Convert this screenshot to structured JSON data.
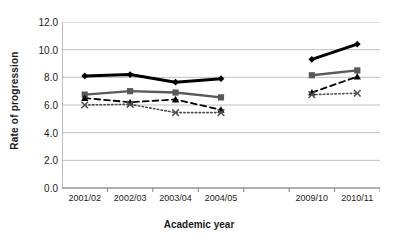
{
  "chart_data": {
    "type": "line",
    "title": "",
    "xlabel": "Academic year",
    "ylabel": "Rate of progression",
    "categories": [
      "2001/02",
      "2002/03",
      "2003/04",
      "2004/05",
      "",
      "2009/10",
      "2010/11"
    ],
    "ylim": [
      0.0,
      12.0
    ],
    "yticks": [
      "0.0",
      "2.0",
      "4.0",
      "6.0",
      "8.0",
      "10.0",
      "12.0"
    ],
    "ytick_values": [
      0.0,
      2.0,
      4.0,
      6.0,
      8.0,
      10.0,
      12.0
    ],
    "grid": "horizontal",
    "legend": "none",
    "gap_after_index": 3,
    "series": [
      {
        "name": "series-1",
        "marker": "diamond",
        "line_style": "solid",
        "color": "#000000",
        "line_width": 3,
        "values": [
          8.1,
          8.2,
          7.65,
          7.9,
          null,
          9.3,
          10.4
        ]
      },
      {
        "name": "series-2",
        "marker": "square",
        "line_style": "solid",
        "color": "#595959",
        "line_width": 2.4,
        "values": [
          6.75,
          7.0,
          6.9,
          6.55,
          null,
          8.15,
          8.5
        ]
      },
      {
        "name": "series-3",
        "marker": "triangle",
        "line_style": "dashed",
        "color": "#000000",
        "line_width": 1.8,
        "values": [
          6.5,
          6.2,
          6.4,
          5.65,
          null,
          6.9,
          8.05
        ]
      },
      {
        "name": "series-4",
        "marker": "x",
        "line_style": "dotted",
        "color": "#4d4d4d",
        "line_width": 1.6,
        "values": [
          6.0,
          6.05,
          5.45,
          5.45,
          null,
          6.75,
          6.85
        ]
      }
    ]
  },
  "axis": {
    "axis_line_color": "#808080",
    "grid_color": "#bfbfbf"
  }
}
